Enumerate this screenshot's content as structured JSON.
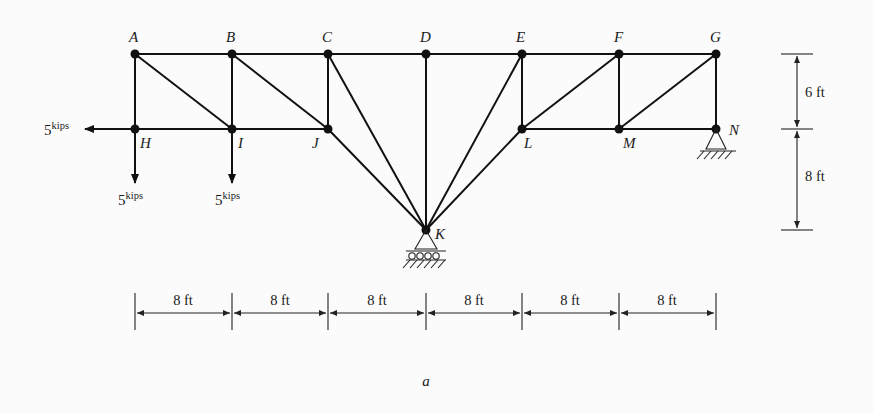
{
  "figure": {
    "caption": "a",
    "joints": {
      "A": {
        "label": "A"
      },
      "B": {
        "label": "B"
      },
      "C": {
        "label": "C"
      },
      "D": {
        "label": "D"
      },
      "E": {
        "label": "E"
      },
      "F": {
        "label": "F"
      },
      "G": {
        "label": "G"
      },
      "H": {
        "label": "H"
      },
      "I": {
        "label": "I"
      },
      "J": {
        "label": "J"
      },
      "K": {
        "label": "K"
      },
      "L": {
        "label": "L"
      },
      "M": {
        "label": "M"
      },
      "N": {
        "label": "N"
      }
    },
    "members": [
      "AB",
      "BC",
      "CD",
      "DE",
      "EF",
      "FG",
      "AH",
      "BI",
      "CJ",
      "DK",
      "EL",
      "FM",
      "GN",
      "HI",
      "IJ",
      "LM",
      "MN",
      "AI",
      "BJ",
      "CK",
      "JK",
      "EK",
      "LK",
      "LF",
      "MG"
    ],
    "loads": [
      {
        "joint": "H",
        "direction": "left",
        "value": "5",
        "unit": "kips"
      },
      {
        "joint": "H",
        "direction": "down",
        "value": "5",
        "unit": "kips"
      },
      {
        "joint": "I",
        "direction": "down",
        "value": "5",
        "unit": "kips"
      }
    ],
    "supports": [
      {
        "joint": "K",
        "type": "roller"
      },
      {
        "joint": "N",
        "type": "pin"
      }
    ],
    "dimensions": {
      "horizontal": [
        "8 ft",
        "8 ft",
        "8 ft",
        "8 ft",
        "8 ft",
        "8 ft"
      ],
      "vertical": [
        "6 ft",
        "8 ft"
      ]
    }
  }
}
